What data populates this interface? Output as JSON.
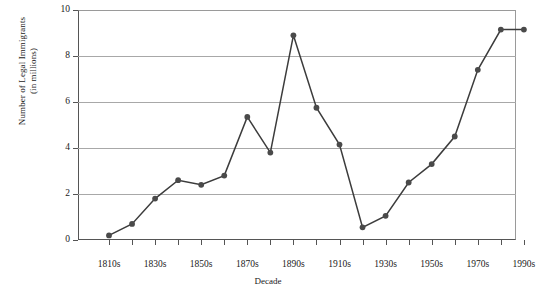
{
  "chart_data": {
    "type": "line",
    "title": "",
    "xlabel": "Decade",
    "ylabel": "Number of Legal Immigrants\n(in millions)",
    "ylabel_line1": "Number of Legal Immigrants",
    "ylabel_line2": "(in millions)",
    "ylim": [
      0,
      10
    ],
    "ytick_values": [
      0,
      2,
      4,
      6,
      8,
      10
    ],
    "ytick_labels": [
      "0",
      "2",
      "4",
      "6",
      "8",
      "10"
    ],
    "xtick_labels": [
      "1810s",
      "1830s",
      "1850s",
      "1870s",
      "1890s",
      "1910s",
      "1930s",
      "1950s",
      "1970s",
      "1990s"
    ],
    "grid": "horizontal",
    "legend": "none",
    "marker": "filled-circle",
    "line_color": "#3c3c3c",
    "marker_color": "#4a4a4a",
    "grid_color": "#a8a8a8",
    "categories": [
      "1810s",
      "1820s",
      "1830s",
      "1840s",
      "1850s",
      "1860s",
      "1870s",
      "1880s",
      "1890s",
      "1900s",
      "1910s",
      "1920s",
      "1930s",
      "1940s",
      "1950s",
      "1960s",
      "1970s",
      "1980s",
      "1990s"
    ],
    "values": [
      0.2,
      0.7,
      1.8,
      2.6,
      2.4,
      2.8,
      5.35,
      3.8,
      8.9,
      5.75,
      4.1,
      0.55,
      1.05,
      2.5,
      3.3,
      4.5,
      7.4,
      9.15,
      9.15
    ],
    "points": [
      {
        "x": "1810s",
        "y": 0.2
      },
      {
        "x": "1820s",
        "y": 0.7
      },
      {
        "x": "1830s",
        "y": 1.8
      },
      {
        "x": "1840s",
        "y": 2.6
      },
      {
        "x": "1850s",
        "y": 2.4
      },
      {
        "x": "1860s",
        "y": 2.8
      },
      {
        "x": "1870s",
        "y": 5.35
      },
      {
        "x": "1880s",
        "y": 3.8
      },
      {
        "x": "1890s",
        "y": 8.9
      },
      {
        "x": "1900s",
        "y": 5.75
      },
      {
        "x": "1910s",
        "y": 4.15
      },
      {
        "x": "1920s",
        "y": 0.55
      },
      {
        "x": "1930s",
        "y": 1.05
      },
      {
        "x": "1940s",
        "y": 2.5
      },
      {
        "x": "1950s",
        "y": 3.3
      },
      {
        "x": "1960s",
        "y": 4.5
      },
      {
        "x": "1970s",
        "y": 7.4
      },
      {
        "x": "1980s",
        "y": 9.15
      },
      {
        "x": "1990s",
        "y": 9.15
      }
    ]
  }
}
